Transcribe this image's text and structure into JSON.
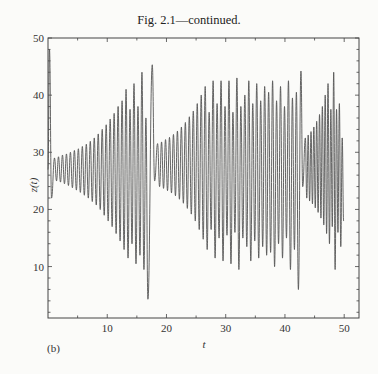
{
  "chart_data": {
    "type": "line",
    "title": "Fig. 2.1—continued.",
    "panel_label": "(b)",
    "xlabel": "t",
    "ylabel": "z(t)",
    "xlim": [
      0,
      52.5
    ],
    "ylim": [
      1,
      50
    ],
    "x_ticks": [
      10,
      20,
      30,
      40,
      50
    ],
    "x_tick_labels": [
      "10",
      "20",
      "30",
      "40",
      "50"
    ],
    "x_minor_step": 5,
    "y_ticks": [
      10,
      20,
      30,
      40,
      50
    ],
    "y_tick_labels": [
      "10",
      "20",
      "30",
      "40",
      "50"
    ],
    "y_minor_step": 2,
    "grid": false,
    "line_color": "#555555",
    "series": [
      {
        "name": "z(t)",
        "initial": {
          "t": 0.0,
          "z": 27
        },
        "segments": [
          {
            "name": "initial transient",
            "extrema": [
              {
                "t": 0.25,
                "z": 48
              },
              {
                "t": 0.6,
                "z": 22
              }
            ]
          },
          {
            "name": "growing oscillation 1",
            "t_start": 0.9,
            "t_end": 17.0,
            "peaks": [
              29,
              29.2,
              29.5,
              29.7,
              30,
              30.3,
              30.6,
              31,
              31.4,
              31.9,
              32.5,
              33.2,
              34,
              34.8,
              35.8,
              36.8,
              38,
              39,
              41,
              37.5,
              42,
              38,
              44,
              36
            ],
            "troughs": [
              25,
              24.8,
              24.5,
              24.2,
              23.8,
              23.4,
              23,
              22.5,
              22,
              21.4,
              20.8,
              20,
              19,
              18,
              17,
              15.8,
              14.5,
              13,
              11.5,
              14,
              10.5,
              12,
              9.5,
              4.3
            ]
          },
          {
            "name": "post-burst spike",
            "extrema": [
              {
                "t": 17.6,
                "z": 45.3
              },
              {
                "t": 18.0,
                "z": 25
              }
            ]
          },
          {
            "name": "growing oscillation 2",
            "t_start": 18.3,
            "t_end": 42.4,
            "peaks": [
              31.5,
              31.8,
              32.2,
              32.6,
              33.1,
              33.7,
              34.4,
              35.2,
              36.2,
              37.2,
              38.5,
              40,
              41.5,
              37,
              42.5,
              38.5,
              42.5,
              38,
              42.5,
              37,
              43,
              38,
              40,
              42.5,
              38.5,
              42,
              39,
              41.5,
              40.5,
              42.5,
              39,
              41.5,
              38,
              42.5,
              39.5,
              40.5
            ],
            "troughs": [
              24,
              23.7,
              23.3,
              22.9,
              22.4,
              21.8,
              21.1,
              20.2,
              19.2,
              18,
              16.5,
              14.8,
              13,
              16.5,
              11.5,
              15,
              11,
              15.5,
              10.5,
              16,
              9.5,
              15,
              13.5,
              11,
              14.5,
              11.5,
              13.5,
              12,
              12.5,
              10,
              14,
              11.5,
              15,
              9.5,
              13,
              6
            ]
          },
          {
            "name": "burst",
            "extrema": [
              {
                "t": 42.7,
                "z": 44.2
              },
              {
                "t": 43.0,
                "z": 24
              }
            ]
          },
          {
            "name": "growing oscillation 3",
            "t_start": 43.3,
            "t_end": 50.0,
            "peaks": [
              32.5,
              33,
              33.6,
              34.4,
              35.4,
              36.6,
              38,
              40,
              42,
              37.5,
              44,
              37.5,
              38.5,
              32.5
            ],
            "troughs": [
              22,
              21.5,
              21,
              20.3,
              19.5,
              18.5,
              17.3,
              15.8,
              14,
              17,
              9.5,
              16,
              13.5,
              18
            ]
          }
        ]
      }
    ]
  }
}
